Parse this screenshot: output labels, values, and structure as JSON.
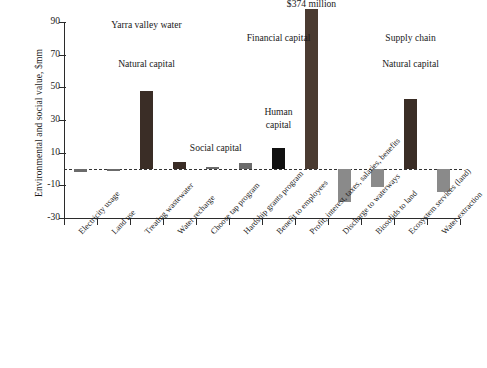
{
  "chart_data": {
    "type": "bar",
    "title": "",
    "xlabel": "",
    "ylabel": "Environmental and social value, $mm",
    "ylim": [
      -30,
      90
    ],
    "yticks": [
      -30,
      -10,
      10,
      30,
      50,
      70,
      90
    ],
    "ytick_labels": [
      "-30",
      "-10",
      "10",
      "30",
      "50",
      "70",
      "90"
    ],
    "grid": false,
    "legend": "none",
    "zero_line": true,
    "categories": [
      "Electricity usage",
      "Land use",
      "Treating wastewater",
      "Water recharge",
      "Choose tap program",
      "Hardship grants program",
      "Benefit to employees",
      "Profit, interest, taxes, salaries, benefits",
      "Discharge to waterways",
      "Biosolids to land",
      "Ecosystem services (land)",
      "Water extraction"
    ],
    "values": [
      -2,
      -0.5,
      48,
      4,
      1,
      3.5,
      13,
      374,
      -20,
      -11,
      43,
      -14
    ],
    "display_values": [
      -2,
      -0.5,
      48,
      4,
      1,
      3.5,
      13,
      98,
      -20,
      -11,
      43,
      -14
    ],
    "bar_colors": [
      "#6b6b6b",
      "#6b6b6b",
      "#3a2d26",
      "#3a2d26",
      "#6b6b6b",
      "#6b6b6b",
      "#111111",
      "#4a3b31",
      "#8a8a8a",
      "#8a8a8a",
      "#3a2d26",
      "#8a8a8a"
    ],
    "annotations": [
      {
        "text": "Yarra valley  water",
        "x_index": 2.0,
        "y": 88
      },
      {
        "text": "Natural capital",
        "x_index": 2.0,
        "y": 64
      },
      {
        "text": "Social capital",
        "x_index": 4.1,
        "y": 13
      },
      {
        "text": "Human\ncapital",
        "x_index": 6.0,
        "y": 34
      },
      {
        "text": "Financial capital",
        "x_index": 6.0,
        "y": 80
      },
      {
        "text": "$374 million",
        "x_index": 7.0,
        "y": 101
      },
      {
        "text": "Supply chain",
        "x_index": 10.0,
        "y": 80
      },
      {
        "text": "Natural capital",
        "x_index": 10.0,
        "y": 64
      }
    ]
  },
  "annotation_labels": {
    "yarra": "Yarra valley  water",
    "natural_left": "Natural capital",
    "social": "Social capital",
    "human_line1": "Human",
    "human_line2": "capital",
    "financial": "Financial capital",
    "value_callout": "$374 million",
    "supply": "Supply chain",
    "natural_right": "Natural capital"
  }
}
